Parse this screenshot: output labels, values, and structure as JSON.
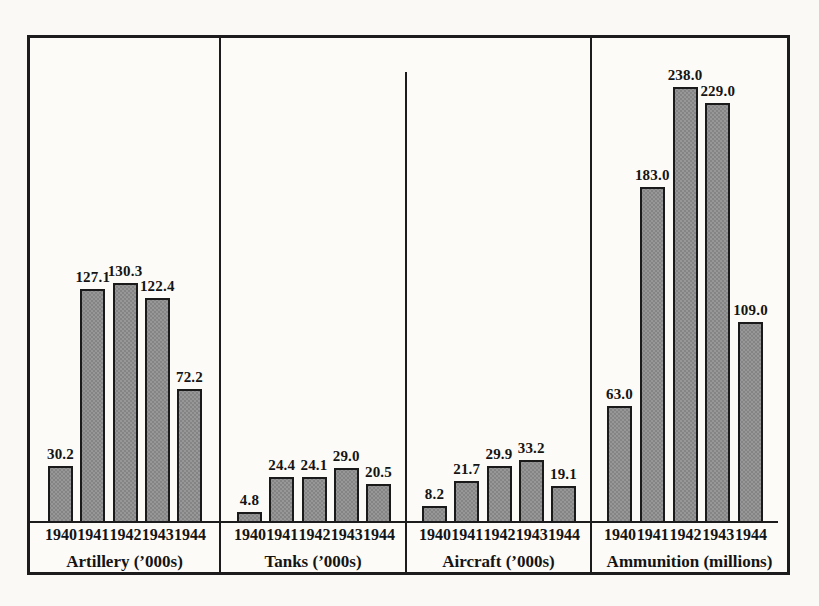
{
  "chart_data": {
    "type": "bar",
    "categories": [
      "1940",
      "1941",
      "1942",
      "1943",
      "1944"
    ],
    "groups": [
      {
        "label": "Artillery (’000s)",
        "values": [
          30.2,
          127.1,
          130.3,
          122.4,
          72.2
        ],
        "value_labels": [
          "30.2",
          "127.1",
          "130.3",
          "122.4",
          "72.2"
        ]
      },
      {
        "label": "Tanks (’000s)",
        "values": [
          4.8,
          24.4,
          24.1,
          29.0,
          20.5
        ],
        "value_labels": [
          "4.8",
          "24.4",
          "24.1",
          "29.0",
          "20.5"
        ]
      },
      {
        "label": "Aircraft (’000s)",
        "values": [
          8.2,
          21.7,
          29.9,
          33.2,
          19.1
        ],
        "value_labels": [
          "8.2",
          "21.7",
          "29.9",
          "33.2",
          "19.1"
        ]
      },
      {
        "label": "Ammunition (millions)",
        "values": [
          63.0,
          183.0,
          238.0,
          229.0,
          109.0
        ],
        "value_labels": [
          "63.0",
          "183.0",
          "238.0",
          "229.0",
          "109.0"
        ]
      }
    ],
    "value_labels_shown": true,
    "ylim": [
      0,
      245
    ],
    "grid": false,
    "legend": "none",
    "bar_color": "#979797",
    "bar_border_color": "#1a1a1a",
    "line_color": "#1c1c1c",
    "background_color": "#fcfbf7"
  }
}
